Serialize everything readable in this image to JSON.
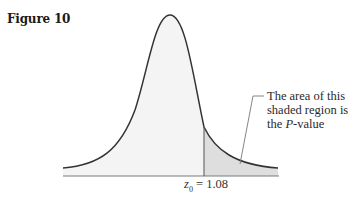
{
  "figure": {
    "title": "Figure 10"
  },
  "callout": {
    "line1": "The area of this",
    "line2": "shaded region is",
    "line3_prefix": "the ",
    "line3_italic": "P",
    "line3_suffix": "-value"
  },
  "critical_value": {
    "var": "z",
    "sub": "0",
    "equals": " = 1.08"
  },
  "colors": {
    "curve": "#333333",
    "fill_body": "#f4f4f4",
    "fill_tail": "#dcdcdc",
    "axis": "#777777"
  }
}
